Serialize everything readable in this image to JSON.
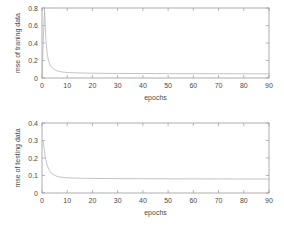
{
  "figure": {
    "background_color": "#ffffff",
    "axis_color": "#9a9a9a",
    "curve_color": "#b4b4b4",
    "text_color": "#4a4a4a"
  },
  "chart_data": [
    {
      "type": "line",
      "panel": "top",
      "title": "",
      "xlabel": "epochs",
      "ylabel": "mse of traning data",
      "xlim": [
        0,
        90
      ],
      "ylim": [
        0,
        0.8
      ],
      "grid": false,
      "legend": null,
      "xticks": [
        0,
        10,
        20,
        30,
        40,
        50,
        60,
        70,
        80,
        90
      ],
      "xtick_labels": [
        "0",
        "10",
        "20",
        "30",
        "40",
        "50",
        "60",
        "70",
        "80",
        "90"
      ],
      "yticks": [
        0,
        0.2,
        0.4,
        0.6,
        0.8
      ],
      "ytick_labels": [
        "0",
        "0.2",
        "0.4",
        "0.6",
        "0.8"
      ],
      "series": [
        {
          "name": "mse of traning data",
          "x": [
            0,
            0.5,
            1,
            1.5,
            2,
            2.5,
            3,
            3.5,
            4,
            5,
            6,
            7,
            8,
            9,
            10,
            12,
            14,
            16,
            18,
            20,
            25,
            30,
            35,
            40,
            45,
            50,
            55,
            60,
            65,
            70,
            75,
            80,
            85,
            90
          ],
          "y": [
            0.0,
            0.42,
            0.8,
            0.46,
            0.29,
            0.21,
            0.165,
            0.135,
            0.118,
            0.095,
            0.082,
            0.074,
            0.069,
            0.066,
            0.063,
            0.06,
            0.058,
            0.057,
            0.056,
            0.055,
            0.053,
            0.052,
            0.0515,
            0.051,
            0.0505,
            0.05,
            0.0498,
            0.0495,
            0.0492,
            0.049,
            0.0488,
            0.0486,
            0.0484,
            0.0482
          ]
        }
      ]
    },
    {
      "type": "line",
      "panel": "bottom",
      "title": "",
      "xlabel": "epochs",
      "ylabel": "mse of testing data",
      "xlim": [
        0,
        90
      ],
      "ylim": [
        0,
        0.4
      ],
      "grid": false,
      "legend": null,
      "xticks": [
        0,
        10,
        20,
        30,
        40,
        50,
        60,
        70,
        80,
        90
      ],
      "xtick_labels": [
        "0",
        "10",
        "20",
        "30",
        "40",
        "50",
        "60",
        "70",
        "80",
        "90"
      ],
      "yticks": [
        0,
        0.1,
        0.2,
        0.3,
        0.4
      ],
      "ytick_labels": [
        "0",
        "0.1",
        "0.2",
        "0.3",
        "0.4"
      ],
      "series": [
        {
          "name": "mse of testing data",
          "x": [
            0,
            0.5,
            1,
            1.5,
            2,
            2.5,
            3,
            3.5,
            4,
            5,
            6,
            7,
            8,
            9,
            10,
            12,
            14,
            16,
            18,
            20,
            25,
            30,
            35,
            40,
            45,
            50,
            55,
            60,
            65,
            70,
            75,
            80,
            85,
            90
          ],
          "y": [
            0.3,
            0.295,
            0.235,
            0.19,
            0.162,
            0.142,
            0.128,
            0.118,
            0.111,
            0.101,
            0.095,
            0.0915,
            0.0895,
            0.0882,
            0.0872,
            0.0858,
            0.0849,
            0.0843,
            0.0838,
            0.0834,
            0.0827,
            0.0822,
            0.0818,
            0.0815,
            0.0812,
            0.081,
            0.0808,
            0.0806,
            0.0804,
            0.0803,
            0.0802,
            0.0801,
            0.08,
            0.0799
          ]
        }
      ]
    }
  ]
}
